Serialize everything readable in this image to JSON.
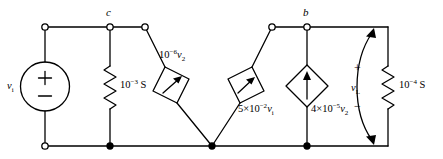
{
  "figure": {
    "type": "circuit-schematic"
  },
  "nodes": {
    "c_label": "c",
    "b_label": "b"
  },
  "source": {
    "name": "independent-voltage-source",
    "label": "v",
    "label_sub": "i",
    "plus": "+",
    "minus": "−"
  },
  "components": {
    "conductance_left": {
      "name": "conductance-1e-3",
      "mantissa": "10",
      "exponent": "−3",
      "unit": " S"
    },
    "conductance_right": {
      "name": "conductance-1e-4",
      "mantissa": "10",
      "exponent": "−4",
      "unit": " S"
    },
    "dependent_source_1": {
      "name": "dependent-source-1e-6-v2",
      "coefficient": "10",
      "exponent": "−6",
      "variable": "v",
      "variable_sub": "2"
    },
    "dependent_source_2": {
      "name": "dependent-source-5e-2-vi",
      "coefficient": "5×10",
      "exponent": "−2",
      "variable": "v",
      "variable_sub": "i"
    },
    "dependent_source_3": {
      "name": "dependent-source-4e-5-v2",
      "coefficient": "4×10",
      "exponent": "−5",
      "variable": "v",
      "variable_sub": "2"
    }
  },
  "output": {
    "name": "output-voltage-annotation",
    "label": "v",
    "label_sub": "L",
    "plus": "+",
    "minus": "−"
  },
  "colors": {
    "wire": "#000000",
    "background": "#ffffff"
  }
}
